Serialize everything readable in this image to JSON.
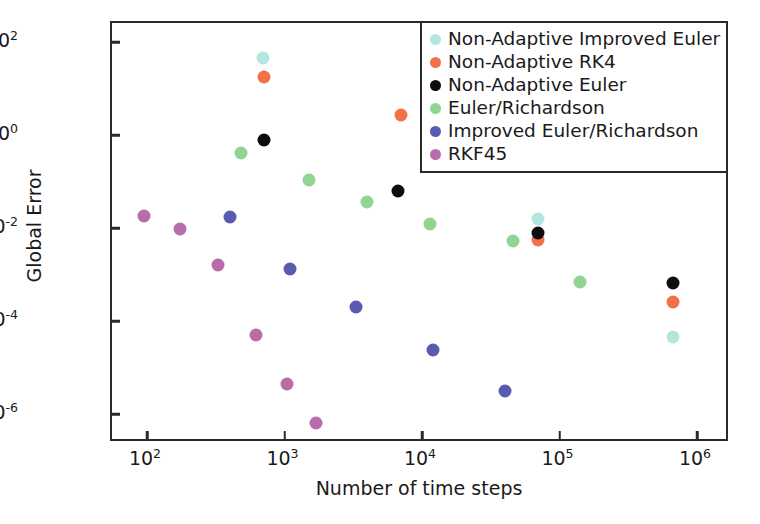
{
  "chart_data": {
    "type": "scatter",
    "title": "",
    "xlabel": "Number of time steps",
    "ylabel": "Global Error",
    "xscale": "log",
    "yscale": "log",
    "xlim": [
      35,
      2000000
    ],
    "ylim": [
      2.2e-07,
      550
    ],
    "xticks": [
      100,
      1000,
      10000,
      100000,
      1000000
    ],
    "xticklabels": [
      "10²",
      "10³",
      "10⁴",
      "10⁵",
      "10⁶"
    ],
    "yticks": [
      100,
      1,
      0.01,
      0.0001,
      1e-06
    ],
    "yticklabels": [
      "10²",
      "10⁰",
      "10⁻²",
      "10⁻⁴",
      "10⁻⁶"
    ],
    "grid": false,
    "legend_position": "upper right",
    "series": [
      {
        "name": "Non-Adaptive Improved Euler",
        "color": "#b3e6e0",
        "points": [
          {
            "x": 700,
            "y": 45
          },
          {
            "x": 70000,
            "y": 0.016
          },
          {
            "x": 670000,
            "y": 4.5e-05
          }
        ]
      },
      {
        "name": "Non-Adaptive RK4",
        "color": "#f2714b",
        "points": [
          {
            "x": 710,
            "y": 18
          },
          {
            "x": 7000,
            "y": 2.7
          },
          {
            "x": 70000,
            "y": 0.0055
          },
          {
            "x": 670000,
            "y": 0.00026
          }
        ]
      },
      {
        "name": "Non-Adaptive Euler",
        "color": "#0d0d0d",
        "points": [
          {
            "x": 710,
            "y": 0.8
          },
          {
            "x": 6700,
            "y": 0.062
          },
          {
            "x": 70000,
            "y": 0.0078
          },
          {
            "x": 670000,
            "y": 0.00065
          }
        ]
      },
      {
        "name": "Euler/Richardson",
        "color": "#92d492",
        "points": [
          {
            "x": 480,
            "y": 0.42
          },
          {
            "x": 1500,
            "y": 0.11
          },
          {
            "x": 4000,
            "y": 0.037
          },
          {
            "x": 11500,
            "y": 0.012
          },
          {
            "x": 46000,
            "y": 0.0053
          },
          {
            "x": 140000,
            "y": 0.00068
          }
        ]
      },
      {
        "name": "Improved Euler/Richardson",
        "color": "#5a5ab0",
        "points": [
          {
            "x": 400,
            "y": 0.017
          },
          {
            "x": 1100,
            "y": 0.0013
          },
          {
            "x": 3300,
            "y": 0.0002
          },
          {
            "x": 12000,
            "y": 2.4e-05
          },
          {
            "x": 40000,
            "y": 3.2e-06
          }
        ]
      },
      {
        "name": "RKF45",
        "color": "#b86cab",
        "points": [
          {
            "x": 95,
            "y": 0.018
          },
          {
            "x": 175,
            "y": 0.0097
          },
          {
            "x": 330,
            "y": 0.0016
          },
          {
            "x": 620,
            "y": 5e-05
          },
          {
            "x": 1050,
            "y": 4.5e-06
          },
          {
            "x": 1700,
            "y": 6.5e-07
          }
        ]
      }
    ]
  }
}
